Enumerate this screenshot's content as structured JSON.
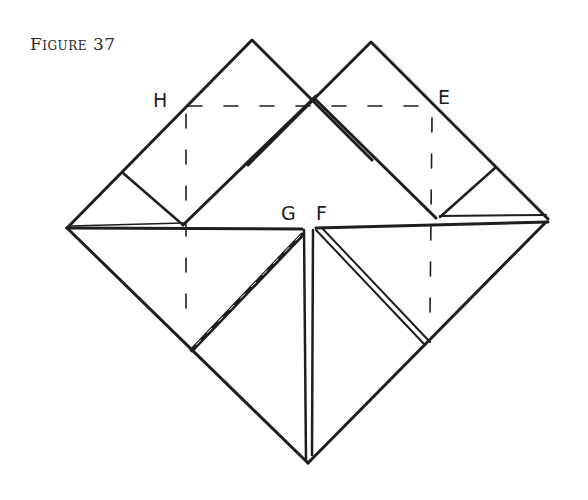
{
  "figure": {
    "caption": "Figure 37",
    "labels": {
      "H": "H",
      "E": "E",
      "G": "G",
      "F": "F"
    },
    "colors": {
      "line": "#1e1e1e",
      "background": "#ffffff"
    }
  }
}
